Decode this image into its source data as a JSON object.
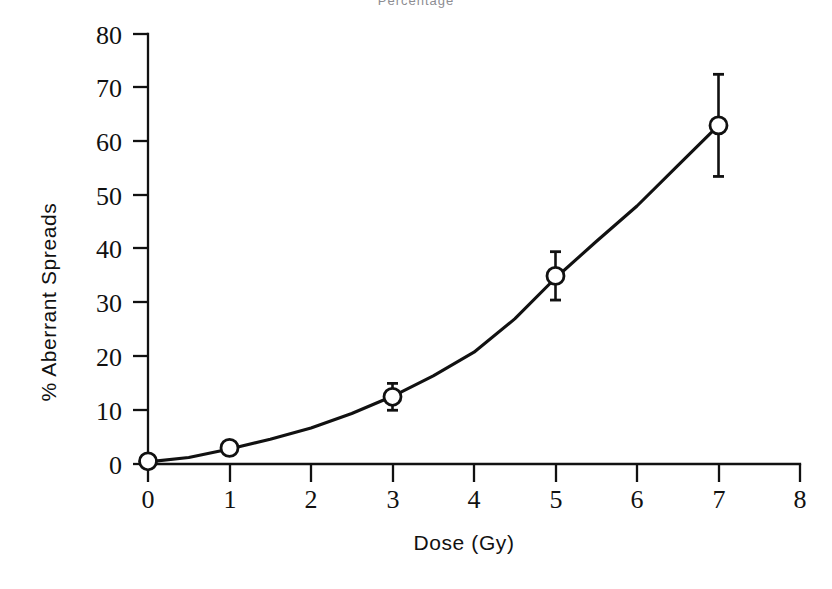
{
  "figure": {
    "clipped_header_text": "Percentage",
    "background_color": "#ffffff",
    "ink_color": "#111111"
  },
  "axes": {
    "x_title": "Dose (Gy)",
    "y_title": "% Aberrant Spreads",
    "x_ticks": [
      "0",
      "1",
      "2",
      "3",
      "4",
      "5",
      "6",
      "7",
      "8"
    ],
    "y_ticks": [
      "0",
      "10",
      "20",
      "30",
      "40",
      "50",
      "60",
      "70",
      "80"
    ]
  },
  "chart_data": {
    "type": "line",
    "title": "",
    "subtitle": "",
    "xlabel": "Dose (Gy)",
    "ylabel": "% Aberrant Spreads",
    "xlim": [
      0,
      8
    ],
    "ylim": [
      0,
      80
    ],
    "xticks": [
      0,
      1,
      2,
      3,
      4,
      5,
      6,
      7,
      8
    ],
    "yticks": [
      0,
      10,
      20,
      30,
      40,
      50,
      60,
      70,
      80
    ],
    "grid": false,
    "legend": false,
    "legend_position": "none",
    "marker": "open-circle",
    "error_bars": "vertical",
    "series": [
      {
        "name": "% Aberrant Spreads",
        "x": [
          0,
          1,
          3,
          5,
          7
        ],
        "values": [
          0.5,
          3.0,
          12.5,
          35.0,
          63.0
        ],
        "yerr": [
          0.5,
          1.0,
          2.5,
          4.5,
          9.5
        ]
      }
    ],
    "fitted_curve": {
      "description": "linear-quadratic fit through data points",
      "x": [
        0,
        0.5,
        1,
        1.5,
        2,
        2.5,
        3,
        3.5,
        4,
        4.5,
        5,
        5.5,
        6,
        6.5,
        7
      ],
      "y": [
        0.4,
        1.2,
        2.8,
        4.6,
        6.7,
        9.4,
        12.6,
        16.4,
        20.8,
        27.0,
        34.6,
        41.4,
        48.0,
        55.5,
        63.0
      ]
    }
  }
}
